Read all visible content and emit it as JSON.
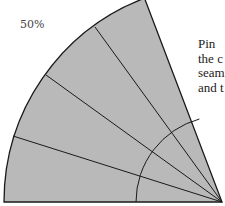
{
  "scale_label": "50%",
  "caption_lines": [
    "Pin",
    "the c",
    "seam",
    "and t"
  ],
  "colors": {
    "fill": "#b9b9b9",
    "stroke": "#1a1a1a",
    "background": "#ffffff"
  },
  "geometry": {
    "apex": [
      222,
      202
    ],
    "outer_radius": 218,
    "inner_radius": 86,
    "wedge_start_deg": 180,
    "wedge_end_deg": 110.8,
    "divider_angles_deg": [
      163.5,
      145.5,
      127.5
    ]
  }
}
